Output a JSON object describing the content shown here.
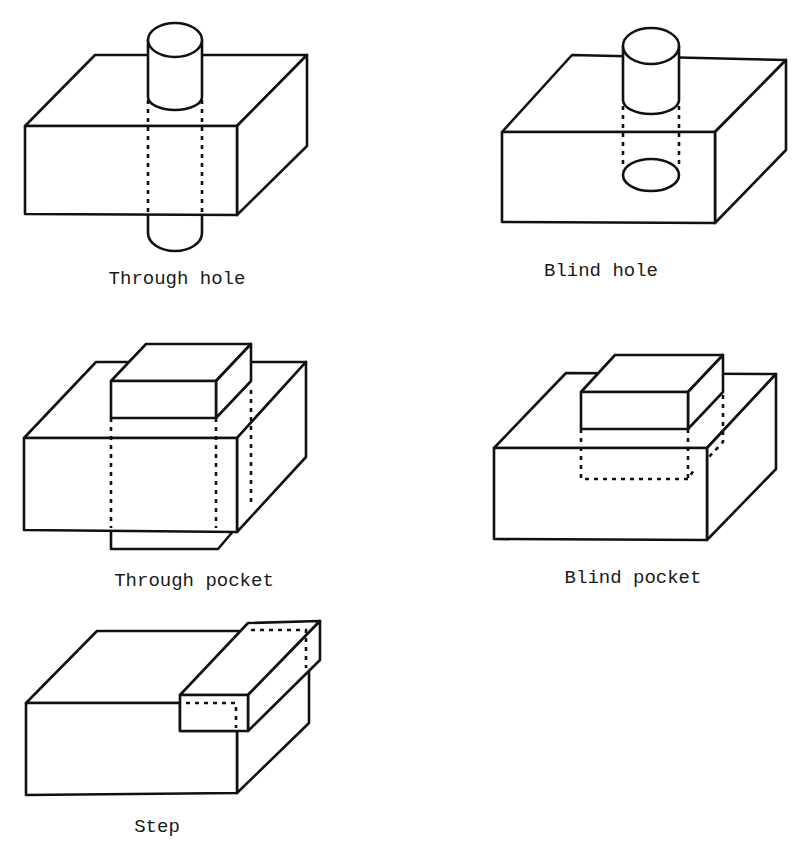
{
  "figure": {
    "features": [
      {
        "id": "through-hole",
        "label": "Through hole"
      },
      {
        "id": "blind-hole",
        "label": "Blind hole"
      },
      {
        "id": "through-pocket",
        "label": "Through pocket"
      },
      {
        "id": "blind-pocket",
        "label": "Blind pocket"
      },
      {
        "id": "step",
        "label": "Step"
      }
    ]
  }
}
